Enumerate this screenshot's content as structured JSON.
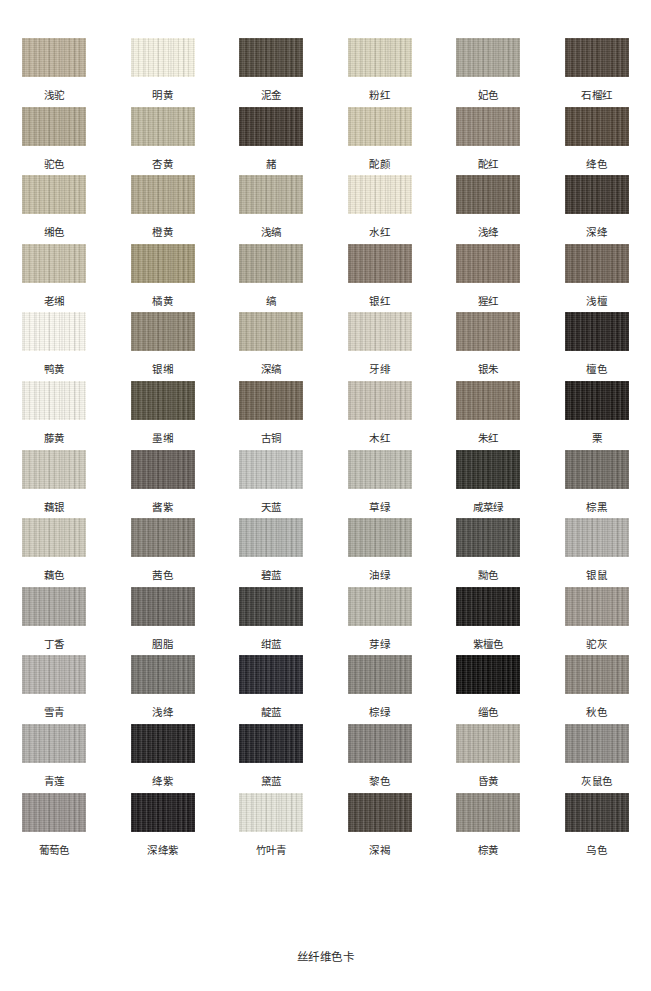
{
  "caption": "丝纤维色卡",
  "grid": {
    "columns": 6,
    "rows": 13
  },
  "chart_data": {
    "type": "table",
    "title": "丝纤维色卡",
    "xlabel": "",
    "ylabel": "",
    "columns": 6,
    "rows": 13,
    "categories": [
      "浅驼",
      "明黄",
      "泥金",
      "粉红",
      "妃色",
      "石榴红",
      "驼色",
      "杏黄",
      "赭",
      "酡颜",
      "酡红",
      "绛色",
      "缃色",
      "橙黄",
      "浅缟",
      "水红",
      "浅绛",
      "深绛",
      "老缃",
      "橘黄",
      "缟",
      "银红",
      "猩红",
      "浅檀",
      "鸭黄",
      "银缃",
      "深缟",
      "牙绯",
      "银朱",
      "檀色",
      "藤黄",
      "墨缃",
      "古铜",
      "木红",
      "朱红",
      "栗",
      "藕银",
      "酱紫",
      "天蓝",
      "草绿",
      "咸菜绿",
      "棕黑",
      "藕色",
      "茜色",
      "碧蓝",
      "油绿",
      "黝色",
      "银鼠",
      "丁香",
      "胭脂",
      "绀蓝",
      "芽绿",
      "紫檀色",
      "驼灰",
      "雪青",
      "浅绛",
      "靛蓝",
      "棕绿",
      "缁色",
      "秋色",
      "青莲",
      "绛紫",
      "黛蓝",
      "黎色",
      "昏黄",
      "灰鼠色",
      "葡萄色",
      "深绛紫",
      "竹叶青",
      "深褐",
      "棕黄",
      "乌色"
    ],
    "values": [
      "#bcb099",
      "#f7f4e4",
      "#4e463a",
      "#d9d4bc",
      "#a9a598",
      "#4d4238",
      "#b2a890",
      "#bdb79e",
      "#3f362d",
      "#d1c9ae",
      "#8f8375",
      "#514437",
      "#c5bda4",
      "#b1a88d",
      "#b6b09a",
      "#efe9d6",
      "#6b6052",
      "#3c342c",
      "#c9c2ab",
      "#a29877",
      "#aaa490",
      "#86786a",
      "#847566",
      "#6e6154",
      "#fbf9f0",
      "#8d8471",
      "#b8b29c",
      "#d7d2c3",
      "#8a7d6e",
      "#241f1c",
      "#f7f5ec",
      "#55503f",
      "#6f6352",
      "#c8c2b4",
      "#7f7262",
      "#1d1916",
      "#cfcbbd",
      "#635c56",
      "#c3c4c0",
      "#bdbcb1",
      "#2e2e28",
      "#6e6962",
      "#cecabb",
      "#807b72",
      "#b0b2ae",
      "#a8a79c",
      "#4b4a45",
      "#b2b0ab",
      "#a9a6a0",
      "#6a6661",
      "#3c3b38",
      "#b6b4a8",
      "#191715",
      "#9d968d",
      "#b5b2ad",
      "#72706b",
      "#23232a",
      "#84817a",
      "#0c0b0a",
      "#8c857c",
      "#b0aeaa",
      "#201e1f",
      "#1f1f24",
      "#827e79",
      "#b4b0a4",
      "#8d8a85",
      "#97918e",
      "#1b181a",
      "#e4e4d9",
      "#4a433b",
      "#8f8a80",
      "#3a3632"
    ],
    "legend": [],
    "grid_on": false
  },
  "swatches": [
    {
      "label": "浅驼",
      "color": "#bcb099"
    },
    {
      "label": "明黄",
      "color": "#f7f4e4"
    },
    {
      "label": "泥金",
      "color": "#4e463a"
    },
    {
      "label": "粉红",
      "color": "#d9d4bc"
    },
    {
      "label": "妃色",
      "color": "#a9a598"
    },
    {
      "label": "石榴红",
      "color": "#4d4238"
    },
    {
      "label": "驼色",
      "color": "#b2a890"
    },
    {
      "label": "杏黄",
      "color": "#bdb79e"
    },
    {
      "label": "赭",
      "color": "#3f362d"
    },
    {
      "label": "酡颜",
      "color": "#d1c9ae"
    },
    {
      "label": "酡红",
      "color": "#8f8375"
    },
    {
      "label": "绛色",
      "color": "#514437"
    },
    {
      "label": "缃色",
      "color": "#c5bda4"
    },
    {
      "label": "橙黄",
      "color": "#b1a88d"
    },
    {
      "label": "浅缟",
      "color": "#b6b09a"
    },
    {
      "label": "水红",
      "color": "#efe9d6"
    },
    {
      "label": "浅绛",
      "color": "#6b6052"
    },
    {
      "label": "深绛",
      "color": "#3c342c"
    },
    {
      "label": "老缃",
      "color": "#c9c2ab"
    },
    {
      "label": "橘黄",
      "color": "#a29877"
    },
    {
      "label": "缟",
      "color": "#aaa490"
    },
    {
      "label": "银红",
      "color": "#86786a"
    },
    {
      "label": "猩红",
      "color": "#847566"
    },
    {
      "label": "浅檀",
      "color": "#6e6154"
    },
    {
      "label": "鸭黄",
      "color": "#fbf9f0"
    },
    {
      "label": "银缃",
      "color": "#8d8471"
    },
    {
      "label": "深缟",
      "color": "#b8b29c"
    },
    {
      "label": "牙绯",
      "color": "#d7d2c3"
    },
    {
      "label": "银朱",
      "color": "#8a7d6e"
    },
    {
      "label": "檀色",
      "color": "#241f1c"
    },
    {
      "label": "藤黄",
      "color": "#f7f5ec"
    },
    {
      "label": "墨缃",
      "color": "#55503f"
    },
    {
      "label": "古铜",
      "color": "#6f6352"
    },
    {
      "label": "木红",
      "color": "#c8c2b4"
    },
    {
      "label": "朱红",
      "color": "#7f7262"
    },
    {
      "label": "栗",
      "color": "#1d1916"
    },
    {
      "label": "藕银",
      "color": "#cfcbbd"
    },
    {
      "label": "酱紫",
      "color": "#635c56"
    },
    {
      "label": "天蓝",
      "color": "#c3c4c0"
    },
    {
      "label": "草绿",
      "color": "#bdbcb1"
    },
    {
      "label": "咸菜绿",
      "color": "#2e2e28"
    },
    {
      "label": "棕黑",
      "color": "#6e6962"
    },
    {
      "label": "藕色",
      "color": "#cecabb"
    },
    {
      "label": "茜色",
      "color": "#807b72"
    },
    {
      "label": "碧蓝",
      "color": "#b0b2ae"
    },
    {
      "label": "油绿",
      "color": "#a8a79c"
    },
    {
      "label": "黝色",
      "color": "#4b4a45"
    },
    {
      "label": "银鼠",
      "color": "#b2b0ab"
    },
    {
      "label": "丁香",
      "color": "#a9a6a0"
    },
    {
      "label": "胭脂",
      "color": "#6a6661"
    },
    {
      "label": "绀蓝",
      "color": "#3c3b38"
    },
    {
      "label": "芽绿",
      "color": "#b6b4a8"
    },
    {
      "label": "紫檀色",
      "color": "#191715"
    },
    {
      "label": "驼灰",
      "color": "#9d968d"
    },
    {
      "label": "雪青",
      "color": "#b5b2ad"
    },
    {
      "label": "浅绛",
      "color": "#72706b"
    },
    {
      "label": "靛蓝",
      "color": "#23232a"
    },
    {
      "label": "棕绿",
      "color": "#84817a"
    },
    {
      "label": "缁色",
      "color": "#0c0b0a"
    },
    {
      "label": "秋色",
      "color": "#8c857c"
    },
    {
      "label": "青莲",
      "color": "#b0aeaa"
    },
    {
      "label": "绛紫",
      "color": "#201e1f"
    },
    {
      "label": "黛蓝",
      "color": "#1f1f24"
    },
    {
      "label": "黎色",
      "color": "#827e79"
    },
    {
      "label": "昏黄",
      "color": "#b4b0a4"
    },
    {
      "label": "灰鼠色",
      "color": "#8d8a85"
    },
    {
      "label": "葡萄色",
      "color": "#97918e"
    },
    {
      "label": "深绛紫",
      "color": "#1b181a"
    },
    {
      "label": "竹叶青",
      "color": "#e4e4d9"
    },
    {
      "label": "深褐",
      "color": "#4a433b"
    },
    {
      "label": "棕黄",
      "color": "#8f8a80"
    },
    {
      "label": "乌色",
      "color": "#3a3632"
    }
  ]
}
